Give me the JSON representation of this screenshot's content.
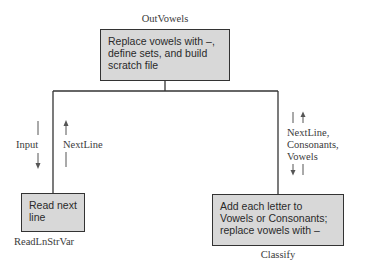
{
  "diagram": {
    "type": "structure-chart",
    "modules": [
      {
        "id": "outvowels",
        "name": "OutVowels",
        "description": "Replace vowels with –,\ndefine sets, and build\nscratch file"
      },
      {
        "id": "readlnstrvar",
        "name": "ReadLnStrVar",
        "description": "Read next\nline"
      },
      {
        "id": "classify",
        "name": "Classify",
        "description": "Add each letter to\nVowels or Consonants;\nreplace vowels with –"
      }
    ],
    "flows": {
      "left_down": "Input",
      "left_up": "NextLine",
      "right_both": [
        "NextLine,",
        "Consonants,",
        "Vowels"
      ]
    },
    "colors": {
      "box_fill": "#d8d8d8",
      "line": "#333333"
    }
  }
}
